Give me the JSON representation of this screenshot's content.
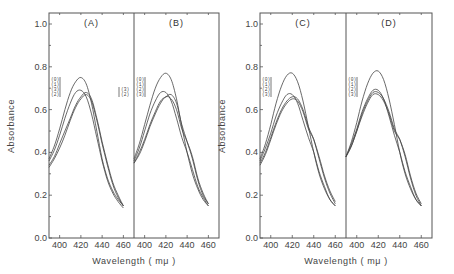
{
  "figure": {
    "ylabel": "Absorbance",
    "xlabel": "Wavelength ( mμ )",
    "y_ticks": [
      "0.0",
      "0.2",
      "0.4",
      "0.6",
      "0.8",
      "1.0"
    ],
    "x_ticks": [
      "400",
      "420",
      "440",
      "460"
    ]
  },
  "chart_data": [
    {
      "type": "line",
      "title": "(A)",
      "xlabel": "Wavelength ( mμ )",
      "ylabel": "Absorbance",
      "xlim": [
        390,
        470
      ],
      "ylim": [
        0.0,
        1.05
      ],
      "x": [
        390,
        395,
        400,
        405,
        410,
        415,
        420,
        425,
        430,
        435,
        440,
        445,
        450,
        455,
        460
      ],
      "legend": [
        "(0)",
        "(1)",
        "(3)",
        "(2)"
      ],
      "series": [
        {
          "name": "(0)",
          "values": [
            0.37,
            0.43,
            0.51,
            0.6,
            0.68,
            0.73,
            0.75,
            0.72,
            0.63,
            0.5,
            0.37,
            0.28,
            0.22,
            0.18,
            0.15
          ]
        },
        {
          "name": "(1)",
          "values": [
            0.36,
            0.41,
            0.48,
            0.56,
            0.63,
            0.68,
            0.69,
            0.66,
            0.58,
            0.47,
            0.36,
            0.27,
            0.21,
            0.17,
            0.14
          ]
        },
        {
          "name": "(3)",
          "values": [
            0.34,
            0.38,
            0.44,
            0.5,
            0.56,
            0.62,
            0.66,
            0.68,
            0.65,
            0.56,
            0.45,
            0.35,
            0.26,
            0.2,
            0.15
          ]
        },
        {
          "name": "(2)",
          "values": [
            0.33,
            0.37,
            0.42,
            0.48,
            0.55,
            0.61,
            0.65,
            0.67,
            0.64,
            0.55,
            0.44,
            0.34,
            0.25,
            0.19,
            0.15
          ]
        }
      ]
    },
    {
      "type": "line",
      "title": "(B)",
      "xlabel": "Wavelength ( mμ )",
      "ylabel": "Absorbance",
      "xlim": [
        390,
        470
      ],
      "ylim": [
        0.0,
        1.05
      ],
      "x": [
        390,
        395,
        400,
        405,
        410,
        415,
        420,
        425,
        430,
        435,
        440,
        445,
        450,
        455,
        460
      ],
      "legend": [
        "(0)",
        "(1)",
        "(2)",
        "(3)"
      ],
      "series": [
        {
          "name": "(0)",
          "values": [
            0.37,
            0.44,
            0.53,
            0.62,
            0.7,
            0.75,
            0.77,
            0.74,
            0.65,
            0.52,
            0.4,
            0.3,
            0.23,
            0.18,
            0.15
          ]
        },
        {
          "name": "(1)",
          "values": [
            0.36,
            0.42,
            0.5,
            0.58,
            0.64,
            0.68,
            0.68,
            0.64,
            0.56,
            0.47,
            0.4,
            0.32,
            0.24,
            0.19,
            0.15
          ]
        },
        {
          "name": "(2)",
          "values": [
            0.35,
            0.4,
            0.46,
            0.53,
            0.59,
            0.64,
            0.66,
            0.67,
            0.63,
            0.53,
            0.45,
            0.37,
            0.27,
            0.2,
            0.16
          ]
        },
        {
          "name": "(3)",
          "values": [
            0.35,
            0.39,
            0.45,
            0.52,
            0.58,
            0.63,
            0.66,
            0.65,
            0.6,
            0.51,
            0.45,
            0.38,
            0.28,
            0.21,
            0.16
          ]
        }
      ]
    },
    {
      "type": "line",
      "title": "(C)",
      "xlabel": "Wavelength ( mμ )",
      "ylabel": "Absorbance",
      "xlim": [
        390,
        470
      ],
      "ylim": [
        0.0,
        1.05
      ],
      "x": [
        390,
        395,
        400,
        405,
        410,
        415,
        420,
        425,
        430,
        435,
        440,
        445,
        450,
        455,
        460
      ],
      "legend": [
        "(0)",
        "(1)",
        "(2)",
        "(3)"
      ],
      "series": [
        {
          "name": "(0)",
          "values": [
            0.37,
            0.44,
            0.53,
            0.63,
            0.71,
            0.76,
            0.77,
            0.73,
            0.64,
            0.52,
            0.4,
            0.3,
            0.23,
            0.18,
            0.15
          ]
        },
        {
          "name": "(1)",
          "values": [
            0.36,
            0.42,
            0.49,
            0.57,
            0.63,
            0.67,
            0.67,
            0.63,
            0.55,
            0.47,
            0.4,
            0.31,
            0.24,
            0.18,
            0.15
          ]
        },
        {
          "name": "(2)",
          "values": [
            0.35,
            0.4,
            0.47,
            0.54,
            0.6,
            0.64,
            0.66,
            0.65,
            0.6,
            0.52,
            0.46,
            0.37,
            0.28,
            0.21,
            0.16
          ]
        },
        {
          "name": "(3)",
          "values": [
            0.34,
            0.39,
            0.46,
            0.53,
            0.59,
            0.63,
            0.65,
            0.64,
            0.59,
            0.51,
            0.46,
            0.38,
            0.29,
            0.22,
            0.17
          ]
        }
      ]
    },
    {
      "type": "line",
      "title": "(D)",
      "xlabel": "Wavelength ( mμ )",
      "ylabel": "Absorbance",
      "xlim": [
        390,
        470
      ],
      "ylim": [
        0.0,
        1.05
      ],
      "x": [
        390,
        395,
        400,
        405,
        410,
        415,
        420,
        425,
        430,
        435,
        440,
        445,
        450,
        455,
        460
      ],
      "legend": [
        "(0)",
        "(1)",
        "(2)",
        "(3)"
      ],
      "series": [
        {
          "name": "(0)",
          "values": [
            0.38,
            0.45,
            0.54,
            0.64,
            0.72,
            0.77,
            0.78,
            0.74,
            0.65,
            0.53,
            0.4,
            0.3,
            0.23,
            0.18,
            0.15
          ]
        },
        {
          "name": "(1)",
          "values": [
            0.38,
            0.44,
            0.51,
            0.59,
            0.65,
            0.69,
            0.69,
            0.65,
            0.57,
            0.48,
            0.4,
            0.31,
            0.24,
            0.18,
            0.15
          ]
        },
        {
          "name": "(2)",
          "values": [
            0.38,
            0.43,
            0.5,
            0.58,
            0.64,
            0.68,
            0.68,
            0.65,
            0.59,
            0.51,
            0.46,
            0.38,
            0.28,
            0.2,
            0.15
          ]
        },
        {
          "name": "(3)",
          "values": [
            0.38,
            0.43,
            0.5,
            0.57,
            0.63,
            0.67,
            0.67,
            0.64,
            0.58,
            0.5,
            0.46,
            0.39,
            0.29,
            0.21,
            0.16
          ]
        }
      ]
    }
  ]
}
